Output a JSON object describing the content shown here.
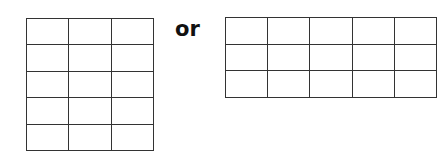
{
  "left_grid": {
    "rows": 5,
    "cols": 3
  },
  "separator": {
    "label": "or"
  },
  "right_grid": {
    "rows": 3,
    "cols": 5
  }
}
